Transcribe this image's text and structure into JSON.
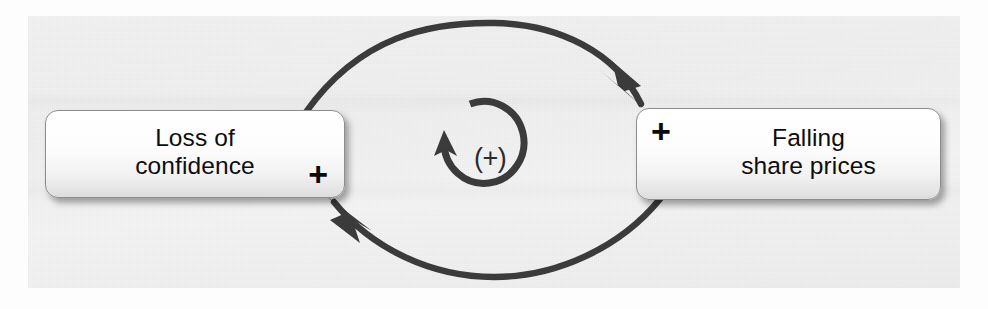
{
  "diagram": {
    "type": "causal-loop-diagram",
    "title": "",
    "loop": {
      "label": "(+)",
      "polarity": "positive",
      "direction": "counter-clockwise",
      "icon": "circular-arrow-icon"
    },
    "stroke_color": "#3a3a3a",
    "background_color": "#f1f1f1",
    "nodes": [
      {
        "id": "loss-of-confidence",
        "label": "Loss of\nconfidence",
        "polarity": "+",
        "polarity_position": "bottom-right",
        "x": 45,
        "y": 110,
        "width": 298,
        "height": 86
      },
      {
        "id": "falling-share-prices",
        "label": "Falling\nshare prices",
        "polarity": "+",
        "polarity_position": "top-left",
        "x": 636,
        "y": 108,
        "width": 303,
        "height": 90
      }
    ],
    "links": [
      {
        "id": "link-top",
        "from": "loss-of-confidence",
        "to": "falling-share-prices",
        "polarity": "+",
        "curve": "arc-over-top"
      },
      {
        "id": "link-bottom",
        "from": "falling-share-prices",
        "to": "loss-of-confidence",
        "polarity": "+",
        "curve": "arc-under-bottom"
      }
    ]
  }
}
